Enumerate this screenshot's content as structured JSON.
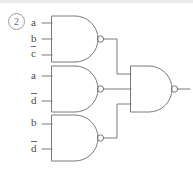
{
  "figure": {
    "index_label": "2",
    "type": "logic-circuit-diagram",
    "stroke_color": "#7a7a7a",
    "text_color": "#4a4a4a"
  },
  "gates": [
    {
      "id": "nand-1",
      "type": "NAND",
      "input_count": 3,
      "inputs": [
        {
          "signal": "a",
          "inverted": false
        },
        {
          "signal": "b",
          "inverted": false
        },
        {
          "signal": "c",
          "inverted": true
        }
      ]
    },
    {
      "id": "nand-2",
      "type": "NAND",
      "input_count": 2,
      "inputs": [
        {
          "signal": "a",
          "inverted": false
        },
        {
          "signal": "d",
          "inverted": true
        }
      ]
    },
    {
      "id": "nand-3",
      "type": "NAND",
      "input_count": 2,
      "inputs": [
        {
          "signal": "b",
          "inverted": false
        },
        {
          "signal": "d",
          "inverted": true
        }
      ]
    },
    {
      "id": "nand-out",
      "type": "NAND",
      "input_count": 3,
      "inputs": [
        {
          "signal": "nand-1",
          "inverted": false
        },
        {
          "signal": "nand-2",
          "inverted": false
        },
        {
          "signal": "nand-3",
          "inverted": false
        }
      ]
    }
  ],
  "input_labels": [
    {
      "id": "g1-in-a",
      "text": "a",
      "overbar": false
    },
    {
      "id": "g1-in-b",
      "text": "b",
      "overbar": false
    },
    {
      "id": "g1-in-c",
      "text": "c",
      "overbar": true
    },
    {
      "id": "g2-in-a",
      "text": "a",
      "overbar": false
    },
    {
      "id": "g2-in-d",
      "text": "d",
      "overbar": true
    },
    {
      "id": "g3-in-b",
      "text": "b",
      "overbar": false
    },
    {
      "id": "g3-in-d",
      "text": "d",
      "overbar": true
    }
  ]
}
